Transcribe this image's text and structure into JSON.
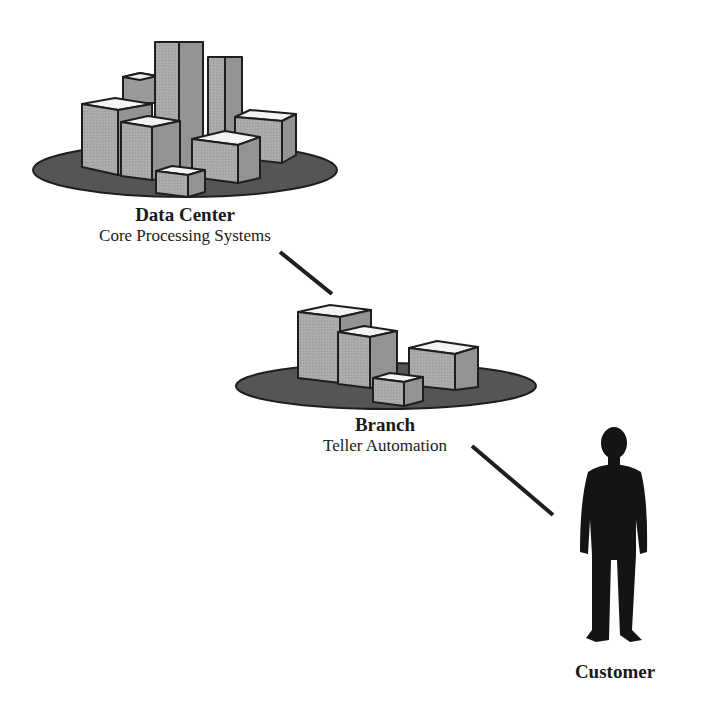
{
  "nodes": {
    "data_center": {
      "title": "Data Center",
      "subtitle": "Core Processing Systems"
    },
    "branch": {
      "title": "Branch",
      "subtitle": "Teller Automation"
    },
    "customer": {
      "title": "Customer"
    }
  },
  "connections": [
    {
      "from": "data_center",
      "to": "branch"
    },
    {
      "from": "branch",
      "to": "customer"
    }
  ],
  "colors": {
    "platform": "#555555",
    "box_face": "#aaaaaa",
    "box_side": "#939393",
    "box_top": "#f4f4f4",
    "silhouette": "#141414",
    "line": "#1e1e1e"
  }
}
